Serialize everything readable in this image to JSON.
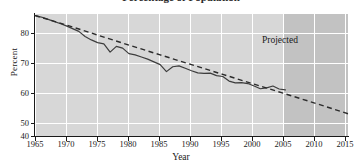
{
  "figure": {
    "title_cutoff": "Percentage of Population",
    "projected_label": "Projected"
  },
  "chart_data": {
    "type": "line",
    "title": "",
    "xlabel": "Year",
    "ylabel": "Percent",
    "xlim": [
      1965,
      2015
    ],
    "ylim": [
      40,
      80
    ],
    "xticks": [
      1965,
      1970,
      1975,
      1980,
      1985,
      1990,
      1995,
      2000,
      2005,
      2010,
      2015
    ],
    "yticks": [
      40,
      50,
      60,
      70,
      80
    ],
    "grid": true,
    "legend": "none",
    "annotations": [
      {
        "text": "Projected",
        "x": 2009,
        "y": 73
      }
    ],
    "shaded_regions": [
      {
        "label": "Projected",
        "x_start": 2005,
        "x_end": 2015,
        "color": "#c2c2c2"
      }
    ],
    "series": [
      {
        "name": "Actual",
        "style": "solid",
        "color": "#3d3d3d",
        "x": [
          1965,
          1966,
          1967,
          1968,
          1969,
          1970,
          1971,
          1972,
          1973,
          1974,
          1975,
          1976,
          1977,
          1978,
          1979,
          1980,
          1981,
          1982,
          1983,
          1984,
          1985,
          1986,
          1987,
          1988,
          1989,
          1990,
          1991,
          1992,
          1993,
          1994,
          1995,
          1996,
          1997,
          1998,
          1999,
          2000,
          2001,
          2002,
          2003,
          2004,
          2005
        ],
        "values": [
          79.5,
          79.0,
          78.3,
          77.6,
          76.9,
          76.1,
          75.2,
          74.3,
          72.6,
          71.5,
          70.6,
          70.2,
          67.5,
          69.4,
          68.8,
          67.0,
          66.6,
          65.9,
          65.2,
          64.3,
          63.4,
          61.1,
          62.7,
          63.0,
          62.2,
          61.4,
          60.7,
          60.5,
          60.6,
          59.8,
          59.5,
          58.0,
          57.4,
          57.5,
          57.2,
          56.4,
          55.5,
          55.8,
          56.4,
          55.4,
          55.1
        ]
      },
      {
        "name": "Projected trend",
        "style": "dashed",
        "color": "#2b2b2b",
        "x": [
          1965,
          1970,
          1975,
          1980,
          1985,
          1990,
          1995,
          2000,
          2005,
          2010,
          2015
        ],
        "values": [
          79.5,
          76.4,
          73.1,
          69.8,
          66.6,
          63.4,
          60.2,
          57.0,
          53.8,
          50.6,
          47.3
        ]
      }
    ]
  }
}
